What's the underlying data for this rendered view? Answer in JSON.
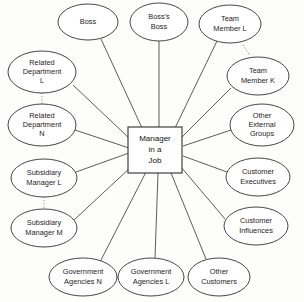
{
  "diagram": {
    "type": "radial-network",
    "background_color": "#fdfdfc",
    "line_color": "#4a4a4a",
    "node_fill": "#ffffff",
    "node_stroke": "#3c3c3c"
  },
  "center": {
    "id": "center",
    "shape": "rectangle",
    "line1": "Manager",
    "line2": "in a",
    "line3": "Job",
    "x": 155,
    "y": 150,
    "width": 54,
    "height": 46
  },
  "nodes": [
    {
      "id": "boss",
      "label": "Boss",
      "lines": [
        "Boss"
      ],
      "shape": "ellipse",
      "cx": 88,
      "cy": 22,
      "rx": 30,
      "ry": 18
    },
    {
      "id": "bosss-boss",
      "label": "Boss's Boss",
      "lines": [
        "Boss's",
        "Boss"
      ],
      "shape": "ellipse",
      "cx": 159,
      "cy": 22,
      "rx": 29,
      "ry": 19
    },
    {
      "id": "team-member-l",
      "label": "Team Member L",
      "lines": [
        "Team",
        "Member L"
      ],
      "shape": "ellipse",
      "cx": 230,
      "cy": 24,
      "rx": 31,
      "ry": 19
    },
    {
      "id": "team-member-k",
      "label": "Team Member K",
      "lines": [
        "Team",
        "Member K"
      ],
      "shape": "ellipse",
      "cx": 258,
      "cy": 76,
      "rx": 31,
      "ry": 19
    },
    {
      "id": "other-external-groups",
      "label": "Other External Groups",
      "lines": [
        "Other",
        "External",
        "Groups"
      ],
      "shape": "ellipse",
      "cx": 262,
      "cy": 125,
      "rx": 32,
      "ry": 21
    },
    {
      "id": "customer-executives",
      "label": "Customer Executives",
      "lines": [
        "Customer",
        "Executives"
      ],
      "shape": "ellipse",
      "cx": 258,
      "cy": 177,
      "rx": 32,
      "ry": 19
    },
    {
      "id": "customer-influences",
      "label": "Customer Influences",
      "lines": [
        "Customer",
        "Influences"
      ],
      "shape": "ellipse",
      "cx": 256,
      "cy": 226,
      "rx": 32,
      "ry": 19
    },
    {
      "id": "other-customers",
      "label": "Other Customers",
      "lines": [
        "Other",
        "Customers"
      ],
      "shape": "ellipse",
      "cx": 219,
      "cy": 277,
      "rx": 31,
      "ry": 19
    },
    {
      "id": "government-agencies-l",
      "label": "Government Agencies L",
      "lines": [
        "Government",
        "Agencies L"
      ],
      "shape": "ellipse",
      "cx": 151,
      "cy": 277,
      "rx": 33,
      "ry": 19
    },
    {
      "id": "government-agencies-n",
      "label": "Government Agencies N",
      "lines": [
        "Government",
        "Agencies N"
      ],
      "shape": "ellipse",
      "cx": 83,
      "cy": 277,
      "rx": 34,
      "ry": 19
    },
    {
      "id": "subsidiary-manager-m",
      "label": "Subsidiary Manager M",
      "lines": [
        "Subsidiary",
        "Manager M"
      ],
      "shape": "ellipse",
      "cx": 44,
      "cy": 228,
      "rx": 33,
      "ry": 19
    },
    {
      "id": "subsidiary-manager-l",
      "label": "Subsidiary Manager L",
      "lines": [
        "Subsidiary",
        "Manager L"
      ],
      "shape": "ellipse",
      "cx": 44,
      "cy": 178,
      "rx": 33,
      "ry": 19
    },
    {
      "id": "related-department-n",
      "label": "Related Department N",
      "lines": [
        "Related",
        "Department",
        "N"
      ],
      "shape": "ellipse",
      "cx": 42,
      "cy": 125,
      "rx": 34,
      "ry": 21
    },
    {
      "id": "related-department-l",
      "label": "Related Department L",
      "lines": [
        "Related",
        "Department",
        "L"
      ],
      "shape": "ellipse",
      "cx": 42,
      "cy": 72,
      "rx": 34,
      "ry": 21
    }
  ],
  "edges": [
    {
      "id": "edge-boss",
      "from": "boss",
      "to": "center",
      "x1": 101,
      "y1": 39,
      "x2": 142,
      "y2": 128
    },
    {
      "id": "edge-bosss-boss",
      "from": "bosss-boss",
      "to": "center",
      "x1": 159,
      "y1": 41,
      "x2": 159,
      "y2": 127
    },
    {
      "id": "edge-team-member-l",
      "from": "team-member-l",
      "to": "center",
      "x1": 217,
      "y1": 41,
      "x2": 175,
      "y2": 128
    },
    {
      "id": "edge-team-member-k",
      "from": "team-member-k",
      "to": "center",
      "x1": 231,
      "y1": 88,
      "x2": 182,
      "y2": 137
    },
    {
      "id": "edge-other-external-groups",
      "from": "other-external-groups",
      "to": "center",
      "x1": 231,
      "y1": 130,
      "x2": 183,
      "y2": 146
    },
    {
      "id": "edge-customer-executives",
      "from": "customer-executives",
      "to": "center",
      "x1": 227,
      "y1": 172,
      "x2": 183,
      "y2": 156
    },
    {
      "id": "edge-customer-influences",
      "from": "customer-influences",
      "to": "center",
      "x1": 225,
      "y1": 219,
      "x2": 181,
      "y2": 167
    },
    {
      "id": "edge-other-customers",
      "from": "other-customers",
      "to": "center",
      "x1": 206,
      "y1": 259,
      "x2": 171,
      "y2": 173
    },
    {
      "id": "edge-government-agencies-l",
      "from": "government-agencies-l",
      "to": "center",
      "x1": 155,
      "y1": 258,
      "x2": 158,
      "y2": 173
    },
    {
      "id": "edge-government-agencies-n",
      "from": "government-agencies-n",
      "to": "center",
      "x1": 100,
      "y1": 262,
      "x2": 146,
      "y2": 172
    },
    {
      "id": "edge-subsidiary-manager-m",
      "from": "subsidiary-manager-m",
      "to": "center",
      "x1": 74,
      "y1": 220,
      "x2": 131,
      "y2": 167
    },
    {
      "id": "edge-subsidiary-manager-l",
      "from": "subsidiary-manager-l",
      "to": "center",
      "x1": 76,
      "y1": 172,
      "x2": 129,
      "y2": 153
    },
    {
      "id": "edge-related-department-n",
      "from": "related-department-n",
      "to": "center",
      "x1": 75,
      "y1": 130,
      "x2": 129,
      "y2": 148
    },
    {
      "id": "edge-related-department-l",
      "from": "related-department-l",
      "to": "center",
      "x1": 73,
      "y1": 85,
      "x2": 130,
      "y2": 139
    }
  ],
  "pair_links": [
    {
      "id": "pairlink-related-departments",
      "from": "related-department-l",
      "to": "related-department-n",
      "x1": 42,
      "y1": 93,
      "x2": 42,
      "y2": 104
    },
    {
      "id": "pairlink-subsidiary-managers",
      "from": "subsidiary-manager-l",
      "to": "subsidiary-manager-m",
      "x1": 44,
      "y1": 197,
      "x2": 44,
      "y2": 209
    },
    {
      "id": "pairlink-government-agencies",
      "from": "government-agencies-n",
      "to": "government-agencies-l",
      "x1": 117,
      "y1": 277,
      "x2": 127,
      "y2": 277
    },
    {
      "id": "pairlink-team-members",
      "from": "team-member-l",
      "to": "team-member-k",
      "x1": 243,
      "y1": 45,
      "x2": 250,
      "y2": 56
    }
  ]
}
